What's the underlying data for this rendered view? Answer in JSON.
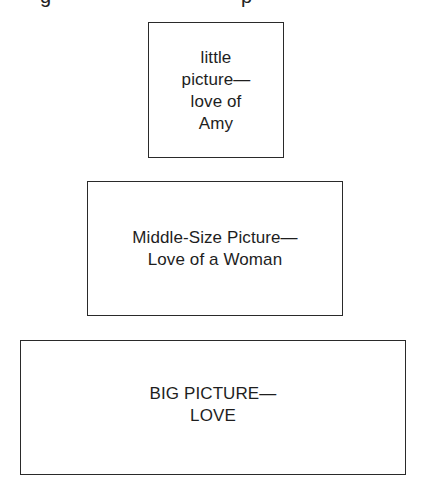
{
  "diagram": {
    "type": "nested-scale comparison",
    "cropped_top_line_fragments": [
      "g",
      "p"
    ],
    "boxes": [
      {
        "id": "small",
        "size": "small",
        "lines": [
          "little",
          "picture—",
          "love of",
          "Amy"
        ],
        "text": "little\npicture—\nlove of\nAmy"
      },
      {
        "id": "medium",
        "size": "medium",
        "lines": [
          "Middle-Size Picture—",
          "Love of a Woman"
        ],
        "text": "Middle-Size Picture—\nLove of a Woman"
      },
      {
        "id": "large",
        "size": "large",
        "lines": [
          "BIG PICTURE—",
          "LOVE"
        ],
        "text": "BIG PICTURE—\nLOVE"
      }
    ],
    "colors": {
      "border": "#2a2a2a",
      "text": "#1e1e1e",
      "background": "#ffffff"
    }
  }
}
